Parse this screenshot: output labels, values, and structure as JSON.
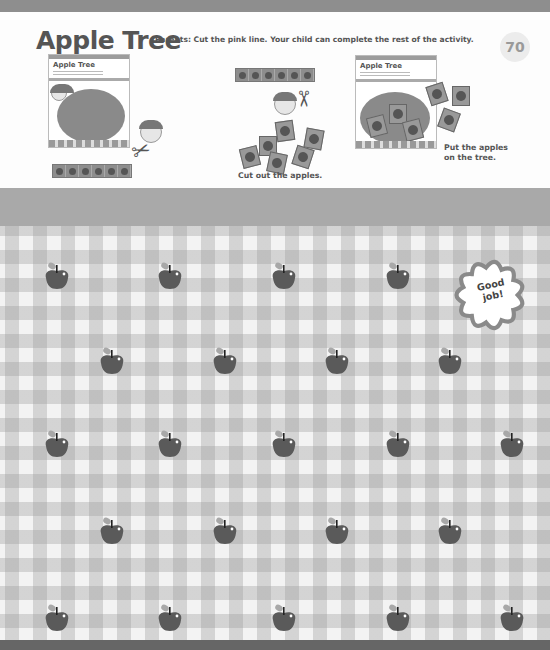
{
  "header": {
    "title": "Apple Tree",
    "instructions": "Parents: Cut the pink line. Your child can complete the rest of the activity.",
    "page_number": "70"
  },
  "steps": [
    {
      "thumb_title": "Apple Tree",
      "caption": ""
    },
    {
      "caption": "Cut out the apples."
    },
    {
      "thumb_title": "Apple Tree",
      "caption_line1": "Put the apples",
      "caption_line2": "on the tree."
    }
  ],
  "badge": {
    "line1": "Good",
    "line2": "job!"
  },
  "apples": {
    "rows": [
      {
        "count": 4,
        "offset": "left"
      },
      {
        "count": 4,
        "offset": "right"
      },
      {
        "count": 5,
        "offset": "left"
      },
      {
        "count": 4,
        "offset": "right"
      },
      {
        "count": 5,
        "offset": "left"
      }
    ],
    "total": 22
  },
  "colors": {
    "apple": "#5a5a5a",
    "leaf": "#a8a8a8",
    "badge_border": "#8a8a8a"
  }
}
